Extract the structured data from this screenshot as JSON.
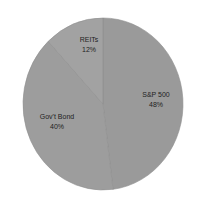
{
  "chart_data": {
    "type": "pie",
    "title": "",
    "categories": [
      "S&P 500",
      "Gov't Bond",
      "REITs"
    ],
    "values": [
      48,
      40,
      12
    ],
    "labels": [
      {
        "name": "S&P 500",
        "pct": "48%"
      },
      {
        "name": "Gov't Bond",
        "pct": "40%"
      },
      {
        "name": "REITs",
        "pct": "12%"
      }
    ],
    "colors": [
      "#9a9a9a",
      "#9d9d9d",
      "#a2a2a2"
    ],
    "start_angle_deg": 0,
    "direction": "clockwise",
    "legend": "none"
  }
}
